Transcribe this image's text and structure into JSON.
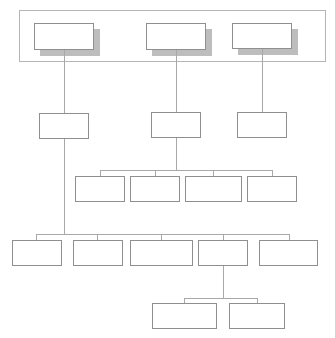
{
  "diagram": {
    "type": "org-chart",
    "frame": {
      "x": 19,
      "y": 10,
      "w": 307,
      "h": 52
    },
    "colors": {
      "box_border": "#8f8f8f",
      "line": "#a8a8a8",
      "shadow": "#bdbdbd",
      "frame": "#b5b5b5",
      "background": "#ffffff"
    },
    "nodes": [
      {
        "id": "top-1",
        "label": "",
        "x": 34,
        "y": 23,
        "w": 60,
        "h": 27,
        "shadow": true
      },
      {
        "id": "top-2",
        "label": "",
        "x": 146,
        "y": 23,
        "w": 60,
        "h": 27,
        "shadow": true
      },
      {
        "id": "top-3",
        "label": "",
        "x": 232,
        "y": 23,
        "w": 60,
        "h": 26,
        "shadow": true
      },
      {
        "id": "l2-a",
        "label": "",
        "x": 39,
        "y": 113,
        "w": 50,
        "h": 26
      },
      {
        "id": "l2-b",
        "label": "",
        "x": 151,
        "y": 112,
        "w": 50,
        "h": 26
      },
      {
        "id": "l2-c",
        "label": "",
        "x": 237,
        "y": 112,
        "w": 50,
        "h": 26
      },
      {
        "id": "l3-1",
        "label": "",
        "x": 75,
        "y": 176,
        "w": 50,
        "h": 26
      },
      {
        "id": "l3-2",
        "label": "",
        "x": 130,
        "y": 176,
        "w": 50,
        "h": 26
      },
      {
        "id": "l3-3",
        "label": "",
        "x": 185,
        "y": 176,
        "w": 57,
        "h": 26
      },
      {
        "id": "l3-4",
        "label": "",
        "x": 247,
        "y": 176,
        "w": 50,
        "h": 26
      },
      {
        "id": "l4-1",
        "label": "",
        "x": 12,
        "y": 240,
        "w": 50,
        "h": 26
      },
      {
        "id": "l4-2",
        "label": "",
        "x": 73,
        "y": 240,
        "w": 50,
        "h": 26
      },
      {
        "id": "l4-3",
        "label": "",
        "x": 130,
        "y": 240,
        "w": 63,
        "h": 26
      },
      {
        "id": "l4-4",
        "label": "",
        "x": 198,
        "y": 240,
        "w": 50,
        "h": 26
      },
      {
        "id": "l4-5",
        "label": "",
        "x": 259,
        "y": 240,
        "w": 59,
        "h": 26
      },
      {
        "id": "l5-1",
        "label": "",
        "x": 152,
        "y": 303,
        "w": 65,
        "h": 26
      },
      {
        "id": "l5-2",
        "label": "",
        "x": 229,
        "y": 303,
        "w": 56,
        "h": 26
      }
    ],
    "edges": [
      {
        "from": "top-1",
        "to": "l2-a"
      },
      {
        "from": "top-2",
        "to": "l2-b"
      },
      {
        "from": "top-3",
        "to": "l2-c"
      },
      {
        "from": "l2-b",
        "to": [
          "l3-1",
          "l3-2",
          "l3-3",
          "l3-4"
        ]
      },
      {
        "from": "l2-a",
        "to": [
          "l4-1",
          "l4-2",
          "l4-3",
          "l4-4",
          "l4-5"
        ]
      },
      {
        "from": "l4-4",
        "to": [
          "l5-1",
          "l5-2"
        ]
      }
    ]
  }
}
